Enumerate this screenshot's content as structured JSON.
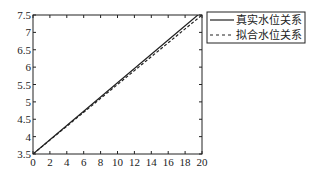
{
  "chart_data": {
    "type": "line",
    "title": "",
    "xlabel": "",
    "ylabel": "",
    "xlim": [
      0,
      20
    ],
    "ylim": [
      3.5,
      7.5
    ],
    "xticks": [
      0,
      2,
      4,
      6,
      8,
      10,
      12,
      14,
      16,
      18,
      20
    ],
    "yticks": [
      3.5,
      4,
      4.5,
      5,
      5.5,
      6,
      6.5,
      7,
      7.5
    ],
    "grid": false,
    "legend_position": "outside-right-top",
    "x": [
      0,
      2,
      4,
      6,
      8,
      10,
      12,
      14,
      16,
      18,
      20
    ],
    "series": [
      {
        "name": "真实水位关系",
        "style": "solid",
        "values": [
          3.5,
          3.91,
          4.32,
          4.73,
          5.14,
          5.55,
          5.96,
          6.37,
          6.78,
          7.19,
          7.6
        ]
      },
      {
        "name": "拟合水位关系",
        "style": "dashed",
        "values": [
          3.5,
          3.9,
          4.3,
          4.7,
          5.1,
          5.5,
          5.9,
          6.3,
          6.7,
          7.1,
          7.5
        ]
      }
    ]
  },
  "legend": {
    "items": [
      {
        "label": "真实水位关系",
        "style": "solid"
      },
      {
        "label": "拟合水位关系",
        "style": "dashed"
      }
    ]
  }
}
